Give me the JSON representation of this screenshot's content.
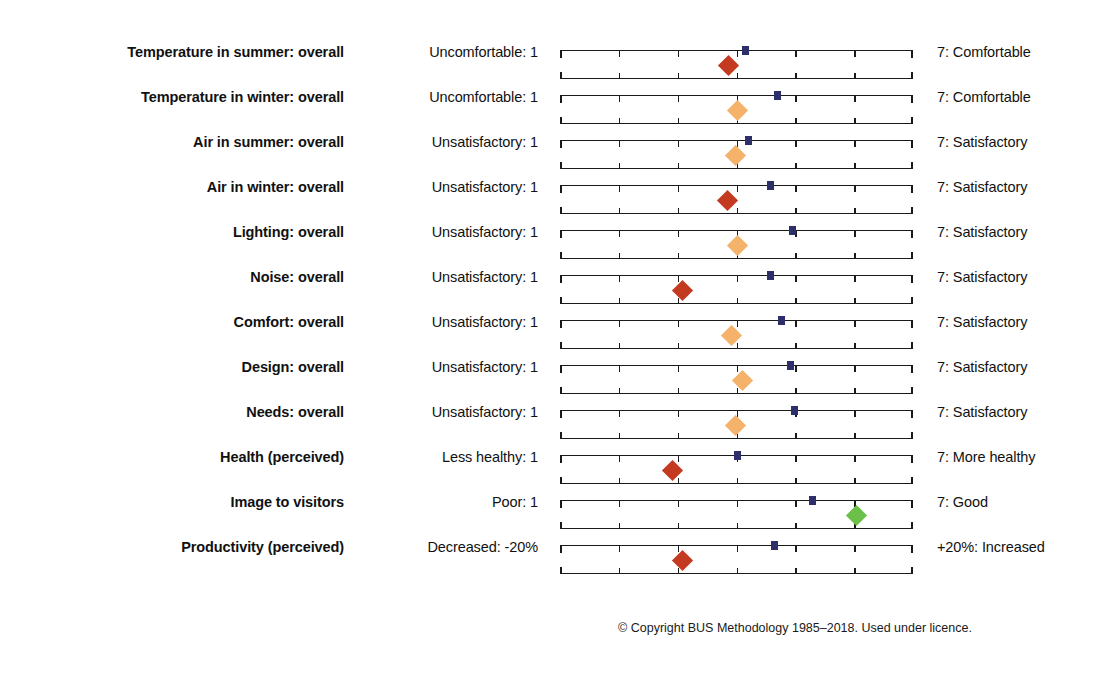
{
  "chart_data": {
    "type": "scatter",
    "title": "",
    "subtitle": "",
    "xlabel": "",
    "ylabel": "",
    "xlim": [
      1,
      7
    ],
    "grid": false,
    "legend": false,
    "scale_min": 1,
    "scale_max": 7,
    "tick_count": 7,
    "series": [
      {
        "name": "Benchmark",
        "marker": "square",
        "color": "#2d2f6b"
      },
      {
        "name": "Score",
        "marker": "diamond"
      }
    ],
    "colors": {
      "benchmark": "#2d2f6b",
      "poor": "#c43a20",
      "neutral": "#f4b26a",
      "good": "#6cc04a",
      "axis": "#1a1a1a"
    },
    "categories": [
      "Temperature in summer: overall",
      "Temperature in winter: overall",
      "Air in summer: overall",
      "Air in winter: overall",
      "Lighting: overall",
      "Noise: overall",
      "Comfort: overall",
      "Design: overall",
      "Needs: overall",
      "Health (perceived)",
      "Image to visitors",
      "Productivity (perceived)"
    ],
    "rows": [
      {
        "label": "Temperature in summer: overall",
        "anchor_low": "Uncomfortable: 1",
        "anchor_high": "7: Comfortable",
        "benchmark": 4.16,
        "score": 3.86,
        "score_color": "#c43a20",
        "score_band": "poor"
      },
      {
        "label": "Temperature in winter: overall",
        "anchor_low": "Uncomfortable: 1",
        "anchor_high": "7: Comfortable",
        "benchmark": 4.69,
        "score": 4.01,
        "score_color": "#f4b26a",
        "score_band": "neutral"
      },
      {
        "label": "Air in summer: overall",
        "anchor_low": "Unsatisfactory: 1",
        "anchor_high": "7: Satisfactory",
        "benchmark": 4.2,
        "score": 3.98,
        "score_color": "#f4b26a",
        "score_band": "neutral"
      },
      {
        "label": "Air in winter: overall",
        "anchor_low": "Unsatisfactory: 1",
        "anchor_high": "7: Satisfactory",
        "benchmark": 4.57,
        "score": 3.84,
        "score_color": "#c43a20",
        "score_band": "poor"
      },
      {
        "label": "Lighting: overall",
        "anchor_low": "Unsatisfactory: 1",
        "anchor_high": "7: Satisfactory",
        "benchmark": 4.96,
        "score": 4.01,
        "score_color": "#f4b26a",
        "score_band": "neutral"
      },
      {
        "label": "Noise: overall",
        "anchor_low": "Unsatisfactory: 1",
        "anchor_high": "7: Satisfactory",
        "benchmark": 4.57,
        "score": 3.09,
        "score_color": "#c43a20",
        "score_band": "poor"
      },
      {
        "label": "Comfort: overall",
        "anchor_low": "Unsatisfactory: 1",
        "anchor_high": "7: Satisfactory",
        "benchmark": 4.77,
        "score": 3.91,
        "score_color": "#f4b26a",
        "score_band": "neutral"
      },
      {
        "label": "Design: overall",
        "anchor_low": "Unsatisfactory: 1",
        "anchor_high": "7: Satisfactory",
        "benchmark": 4.91,
        "score": 4.1,
        "score_color": "#f4b26a",
        "score_band": "neutral"
      },
      {
        "label": "Needs: overall",
        "anchor_low": "Unsatisfactory: 1",
        "anchor_high": "7: Satisfactory",
        "benchmark": 4.98,
        "score": 3.98,
        "score_color": "#f4b26a",
        "score_band": "neutral"
      },
      {
        "label": "Health (perceived)",
        "anchor_low": "Less healthy: 1",
        "anchor_high": "7: More healthy",
        "benchmark": 4.01,
        "score": 2.92,
        "score_color": "#c43a20",
        "score_band": "poor"
      },
      {
        "label": "Image to visitors",
        "anchor_low": "Poor: 1",
        "anchor_high": "7: Good",
        "benchmark": 5.3,
        "score": 6.04,
        "score_color": "#6cc04a",
        "score_band": "good"
      },
      {
        "label": "Productivity (perceived)",
        "anchor_low": "Decreased: -20%",
        "anchor_high": "+20%: Increased",
        "benchmark": 4.64,
        "score": 3.09,
        "score_color": "#c43a20",
        "score_band": "poor"
      }
    ]
  },
  "footer": {
    "copyright": "© Copyright BUS Methodology 1985–2018. Used under licence."
  }
}
